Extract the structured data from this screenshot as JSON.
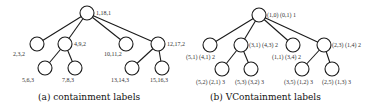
{
  "figure_a": {
    "caption": "(a) containment labels",
    "nodes": [
      {
        "id": "root",
        "label": "1,18,1"
      },
      {
        "id": "n1",
        "label": "2,3,2"
      },
      {
        "id": "n2",
        "label": "4,9,2"
      },
      {
        "id": "n3",
        "label": "10,11,2"
      },
      {
        "id": "n4",
        "label": "12,17,2"
      },
      {
        "id": "n5",
        "label": "5,6,3"
      },
      {
        "id": "n6",
        "label": "7,8,3"
      },
      {
        "id": "n7",
        "label": "13,14,3"
      },
      {
        "id": "n8",
        "label": "15,16,3"
      }
    ]
  },
  "figure_b": {
    "caption": "(b) VContainment labels",
    "nodes": [
      {
        "id": "root",
        "label": "(1,0) (0,1) 1"
      },
      {
        "id": "n1",
        "label": "(5,1) (4,1) 2"
      },
      {
        "id": "n2",
        "label": "(3,1) (4,3) 2"
      },
      {
        "id": "n3",
        "label": "(1,1) (3,4) 2"
      },
      {
        "id": "n4",
        "label": "(2,3) (1,4) 2"
      },
      {
        "id": "n5",
        "label": "(5,2) (2,1) 3"
      },
      {
        "id": "n6",
        "label": "(5,3) (3,2) 3"
      },
      {
        "id": "n7",
        "label": "(3,5) (1,2) 3"
      },
      {
        "id": "n8",
        "label": "(2,5) (1,3) 3"
      }
    ]
  }
}
